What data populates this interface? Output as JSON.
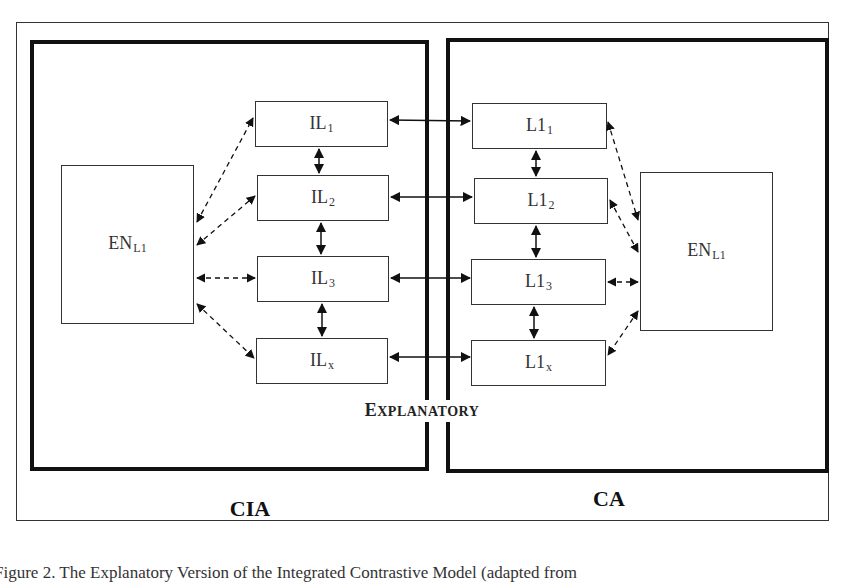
{
  "diagram": {
    "left_panel": {
      "label": "CIA"
    },
    "right_panel": {
      "label": "CA"
    },
    "center_label": {
      "first": "E",
      "rest": "XPLANATORY"
    },
    "left_en": {
      "main": "EN",
      "sub": "L1"
    },
    "right_en": {
      "main": "EN",
      "sub": "L1"
    },
    "il_nodes": [
      {
        "main": "IL",
        "sub": "1"
      },
      {
        "main": "IL",
        "sub": "2"
      },
      {
        "main": "IL",
        "sub": "3"
      },
      {
        "main": "IL",
        "sub": "x"
      }
    ],
    "l1_nodes": [
      {
        "main": "L1",
        "sub": "1"
      },
      {
        "main": "L1",
        "sub": "2"
      },
      {
        "main": "L1",
        "sub": "3"
      },
      {
        "main": "L1",
        "sub": "x"
      }
    ],
    "edges": {
      "solid_bidirectional": [
        "IL1-L11",
        "IL2-L12",
        "IL3-L13",
        "ILx-L1x",
        "IL1-IL2",
        "IL2-IL3",
        "IL3-ILx",
        "L11-L12",
        "L12-L13",
        "L13-L1x"
      ],
      "dashed_bidirectional": [
        "ENleft-IL1",
        "ENleft-IL2",
        "ENleft-IL3",
        "ENleft-ILx",
        "ENright-L11",
        "ENright-L12",
        "ENright-L13",
        "ENright-L1x"
      ]
    },
    "colors": {
      "line": "#111111",
      "box_border": "#333333",
      "background": "#ffffff"
    }
  },
  "caption": "Figure 2. The Explanatory Version of the Integrated Contrastive Model (adapted from"
}
